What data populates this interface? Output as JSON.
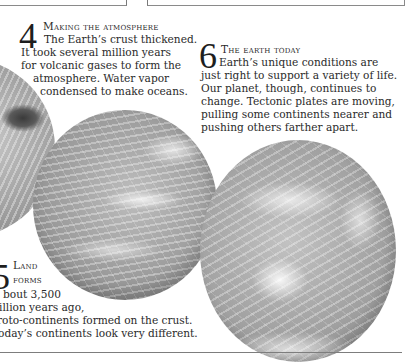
{
  "top_boxes": {
    "left_text": "",
    "right_text": "in the core."
  },
  "sections": [
    {
      "number": "4",
      "heading": "Making the atmosphere",
      "lines": [
        "The Earth’s crust thickened.",
        "It took several million years",
        "for volcanic gases to form the",
        "atmosphere. Water vapor",
        "condensed to make oceans."
      ]
    },
    {
      "number": "6",
      "heading": "The earth today",
      "lines": [
        "Earth’s unique conditions are",
        "just right to support a variety of life.",
        "Our planet, though, continues to",
        "change. Tectonic plates are moving,",
        "pulling some continents nearer and",
        "pushing others farther apart."
      ]
    },
    {
      "number": "5",
      "heading_lines": [
        "Land",
        "forms"
      ],
      "lines": [
        "bout 3,500",
        "illion years ago,",
        "roto-continents formed on the crust.",
        "oday’s continents look very different."
      ]
    }
  ],
  "images": [
    {
      "name": "globe-forming-atmosphere",
      "description": "Earth globe, grayscale"
    },
    {
      "name": "globe-land-forms",
      "description": "Earth globe with clouds, grayscale"
    },
    {
      "name": "globe-earth-today",
      "description": "Earth globe with clouds, grayscale"
    }
  ]
}
